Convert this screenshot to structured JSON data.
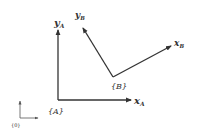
{
  "diagram": {
    "colors": {
      "stroke": "#333333",
      "background": "#ffffff"
    },
    "frames": [
      {
        "id": "0",
        "label": "{0}",
        "origin": [
          20,
          118
        ],
        "x_axis_end": [
          38,
          118
        ],
        "y_axis_end": [
          20,
          100
        ]
      },
      {
        "id": "A",
        "label": "{A}",
        "origin": [
          58,
          100
        ],
        "x_axis_end": [
          132,
          100
        ],
        "y_axis_end": [
          58,
          29
        ],
        "x_label": {
          "main": "x",
          "sub": "A"
        },
        "y_label": {
          "main": "y",
          "sub": "A"
        }
      },
      {
        "id": "B",
        "label": "{B}",
        "origin": [
          113,
          77
        ],
        "x_axis_end": [
          172,
          45
        ],
        "y_axis_end": [
          82,
          27
        ],
        "x_label": {
          "main": "x",
          "sub": "B"
        },
        "y_label": {
          "main": "y",
          "sub": "B"
        }
      }
    ]
  }
}
